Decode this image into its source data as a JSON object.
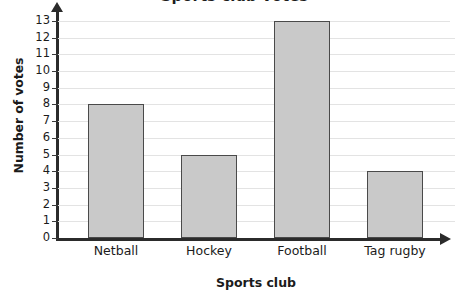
{
  "title_fragment": "Sports club votes",
  "chart_data": {
    "type": "bar",
    "title": "Sports club votes",
    "xlabel": "Sports club",
    "ylabel": "Number of votes",
    "categories": [
      "Netball",
      "Hockey",
      "Football",
      "Tag rugby"
    ],
    "values": [
      8,
      5,
      13,
      4
    ],
    "ylim": [
      0,
      13
    ],
    "ytick_labels": [
      "0",
      "1",
      "2",
      "3",
      "4",
      "5",
      "6",
      "7",
      "8",
      "9",
      "10",
      "11",
      "12",
      "13"
    ],
    "grid": true,
    "legend": "none",
    "bar_fill": "#c9c9c9",
    "bar_border": "#4a4a4a",
    "gridline_color": "#e3e3e3",
    "axis_color": "#2b2b2b"
  }
}
